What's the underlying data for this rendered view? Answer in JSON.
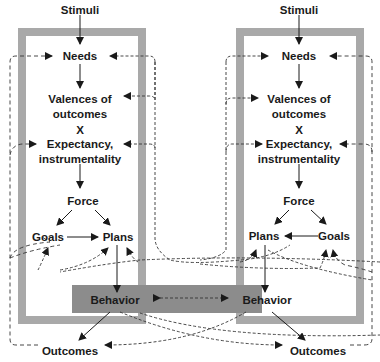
{
  "diagram": {
    "left": {
      "stimuli": "Stimuli",
      "needs": "Needs",
      "valences_line1": "Valences of",
      "valences_line2": "outcomes",
      "times": "X",
      "expectancy_line1": "Expectancy,",
      "expectancy_line2": "instrumentality",
      "force": "Force",
      "goals": "Goals",
      "plans": "Plans",
      "behavior": "Behavior",
      "outcomes": "Outcomes"
    },
    "right": {
      "stimuli": "Stimuli",
      "needs": "Needs",
      "valences_line1": "Valences of",
      "valences_line2": "outcomes",
      "times": "X",
      "expectancy_line1": "Expectancy,",
      "expectancy_line2": "instrumentality",
      "force": "Force",
      "plans": "Plans",
      "goals": "Goals",
      "behavior": "Behavior",
      "outcomes": "Outcomes"
    },
    "colors": {
      "frame": "#a9a9a9",
      "behavior_box": "#8c8c8c",
      "text": "#1a1a1a"
    }
  }
}
